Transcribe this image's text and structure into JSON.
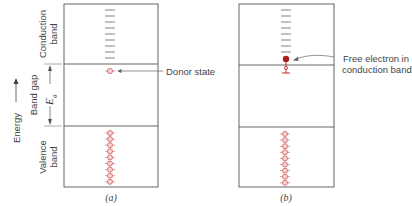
{
  "axis": {
    "energy_label": "Energy"
  },
  "bands": {
    "conduction_line1": "Conduction",
    "conduction_line2": "band",
    "gap_label": "Band gap",
    "gap_symbol": "E",
    "gap_subscript": "g",
    "valence_line1": "Valence",
    "valence_line2": "band"
  },
  "panel_a": {
    "caption": "(a)",
    "annotation": "Donor state",
    "empty_conduction_states": 9,
    "filled_valence_states": 9
  },
  "panel_b": {
    "caption": "(b)",
    "annotation_line1": "Free electron in",
    "annotation_line2": "conduction band",
    "empty_conduction_states": 8,
    "filled_valence_states": 9
  },
  "colors": {
    "frame": "#555555",
    "state_dash": "#666666",
    "electron_outline": "#d46a6a",
    "electron_fill": "#f6d4d4",
    "free_electron": "#b01c1c"
  }
}
